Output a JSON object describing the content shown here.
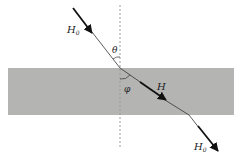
{
  "diagram": {
    "slab": {
      "x": 8,
      "y": 68,
      "width": 226,
      "height": 47,
      "color": "#b4b4b2"
    },
    "normal": {
      "x": 120,
      "y1": 5,
      "y2": 148,
      "color": "#999999"
    },
    "rays": {
      "incident": {
        "x1": 73,
        "y1": 8,
        "x2": 120,
        "y2": 68
      },
      "refracted": {
        "x1": 120,
        "y1": 68,
        "x2": 189,
        "y2": 115
      },
      "emergent": {
        "x1": 189,
        "y1": 115,
        "x2": 218,
        "y2": 151
      }
    },
    "labels": {
      "incident_field": "H",
      "incident_sub": "0",
      "theta": "θ",
      "phi": "φ",
      "slab_field": "H",
      "emergent_field": "H",
      "emergent_sub": "0"
    },
    "colors": {
      "ray": "#222222",
      "arrow": "#111111",
      "normal": "#999999"
    }
  }
}
